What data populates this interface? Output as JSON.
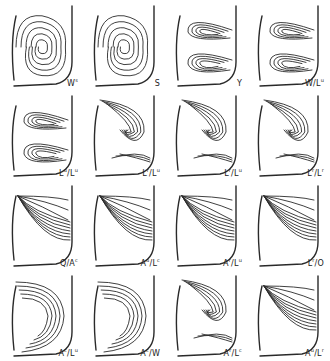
{
  "figure": {
    "type": "grid of streamline flow-pattern sketches",
    "rows": 4,
    "columns": 4,
    "panels": [
      {
        "id": "p1",
        "row": 1,
        "col": 1,
        "label": {
          "base": "W",
          "sup": "s",
          "rest": ""
        }
      },
      {
        "id": "p2",
        "row": 1,
        "col": 2,
        "label": {
          "base": "S",
          "sup": "",
          "rest": ""
        }
      },
      {
        "id": "p3",
        "row": 1,
        "col": 3,
        "label": {
          "base": "Y",
          "sup": "",
          "rest": ""
        }
      },
      {
        "id": "p4",
        "row": 1,
        "col": 4,
        "label": {
          "base": "W/L",
          "sup": "u",
          "rest": ""
        }
      },
      {
        "id": "p5",
        "row": 2,
        "col": 1,
        "label": {
          "base": "L",
          "sup": "u",
          "rest": "/L",
          "sup2": "u"
        }
      },
      {
        "id": "p6",
        "row": 2,
        "col": 2,
        "label": {
          "base": "L",
          "sup": "r",
          "rest": "/L",
          "sup2": "u"
        }
      },
      {
        "id": "p7",
        "row": 2,
        "col": 3,
        "label": {
          "base": "L",
          "sup": "r",
          "rest": "/L",
          "sup2": "u"
        }
      },
      {
        "id": "p8",
        "row": 2,
        "col": 4,
        "label": {
          "base": "L",
          "sup": "r",
          "rest": "/L",
          "sup2": "r"
        }
      },
      {
        "id": "p9",
        "row": 3,
        "col": 1,
        "label": {
          "base": "Q/A",
          "sup": "c",
          "rest": ""
        }
      },
      {
        "id": "p10",
        "row": 3,
        "col": 2,
        "label": {
          "base": "A",
          "sup": "u",
          "rest": "/L",
          "sup2": "c"
        }
      },
      {
        "id": "p11",
        "row": 3,
        "col": 3,
        "label": {
          "base": "A",
          "sup": "r",
          "rest": "/L",
          "sup2": "u"
        }
      },
      {
        "id": "p12",
        "row": 3,
        "col": 4,
        "label": {
          "base": "L",
          "sup": "r",
          "rest": "/O"
        }
      },
      {
        "id": "p13",
        "row": 4,
        "col": 1,
        "label": {
          "base": "A",
          "sup": "c",
          "rest": "/L",
          "sup2": "u"
        }
      },
      {
        "id": "p14",
        "row": 4,
        "col": 2,
        "label": {
          "base": "A",
          "sup": "c",
          "rest": "/W"
        }
      },
      {
        "id": "p15",
        "row": 4,
        "col": 3,
        "label": {
          "base": "A",
          "sup": "r",
          "rest": "/L",
          "sup2": "c"
        }
      },
      {
        "id": "p16",
        "row": 4,
        "col": 4,
        "label": {
          "base": "A",
          "sup": "u",
          "rest": "/L",
          "sup2": "r"
        }
      }
    ]
  },
  "colors": {
    "background": "#ffffff",
    "ink": "#2a2a2a"
  }
}
